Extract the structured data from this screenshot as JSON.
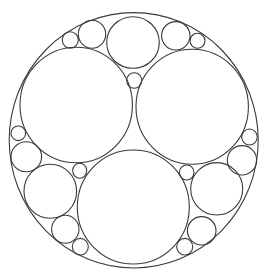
{
  "diagram": {
    "type": "apollonian-circle-packing",
    "canvas": {
      "width": 264,
      "height": 273,
      "background": "#ffffff"
    },
    "stroke_color": "#3a3a3a",
    "outer": {
      "name": "outer-circle",
      "cx": 133.7,
      "cy": 140.3,
      "rx": 124.5,
      "ry": 127.7
    },
    "circles": [
      {
        "name": "large-top-left-circle",
        "cx": 76.2,
        "cy": 105.0,
        "rx": 56.2,
        "ry": 57.7
      },
      {
        "name": "large-top-right-circle",
        "cx": 192.2,
        "cy": 106.7,
        "rx": 56.2,
        "ry": 57.5
      },
      {
        "name": "large-bottom-circle",
        "cx": 133.3,
        "cy": 207.0,
        "rx": 56.0,
        "ry": 57.0
      },
      {
        "name": "top-medium-circle",
        "cx": 133.0,
        "cy": 42.5,
        "rx": 26.3,
        "ry": 25.8
      },
      {
        "name": "center-small-circle",
        "cx": 134.2,
        "cy": 80.5,
        "rx": 7.5,
        "ry": 7.8
      },
      {
        "name": "top-left-medium-circle",
        "cx": 92.0,
        "cy": 34.2,
        "rx": 13.7,
        "ry": 14.0
      },
      {
        "name": "top-left-small-circle",
        "cx": 70.3,
        "cy": 40.0,
        "rx": 8.0,
        "ry": 8.3
      },
      {
        "name": "top-right-medium-circle",
        "cx": 175.8,
        "cy": 35.8,
        "rx": 14.2,
        "ry": 14.2
      },
      {
        "name": "top-right-small-circle",
        "cx": 197.5,
        "cy": 40.8,
        "rx": 7.5,
        "ry": 7.5
      },
      {
        "name": "left-small-circle",
        "cx": 18.3,
        "cy": 133.3,
        "rx": 7.3,
        "ry": 7.3
      },
      {
        "name": "left-medium-circle",
        "cx": 26.3,
        "cy": 156.7,
        "rx": 15.3,
        "ry": 15.0
      },
      {
        "name": "lower-left-large-circle",
        "cx": 50.3,
        "cy": 191.3,
        "rx": 26.3,
        "ry": 27.0
      },
      {
        "name": "lower-left-inner-small-circle",
        "cx": 79.7,
        "cy": 170.8,
        "rx": 7.0,
        "ry": 7.5
      },
      {
        "name": "bottom-left-medium-circle",
        "cx": 65.3,
        "cy": 229.2,
        "rx": 13.7,
        "ry": 14.0
      },
      {
        "name": "bottom-left-small-circle",
        "cx": 80.3,
        "cy": 246.7,
        "rx": 8.0,
        "ry": 8.3
      },
      {
        "name": "right-small-circle",
        "cx": 249.5,
        "cy": 137.0,
        "rx": 7.8,
        "ry": 8.0
      },
      {
        "name": "right-medium-circle",
        "cx": 242.0,
        "cy": 160.3,
        "rx": 14.7,
        "ry": 14.7
      },
      {
        "name": "lower-right-large-circle",
        "cx": 216.7,
        "cy": 188.8,
        "rx": 26.0,
        "ry": 26.2
      },
      {
        "name": "lower-right-inner-small-circle",
        "cx": 186.7,
        "cy": 172.5,
        "rx": 7.3,
        "ry": 7.5
      },
      {
        "name": "bottom-right-medium-circle",
        "cx": 201.7,
        "cy": 230.8,
        "rx": 14.3,
        "ry": 14.2
      },
      {
        "name": "bottom-right-small-circle",
        "cx": 184.7,
        "cy": 246.7,
        "rx": 8.0,
        "ry": 8.3
      }
    ]
  }
}
